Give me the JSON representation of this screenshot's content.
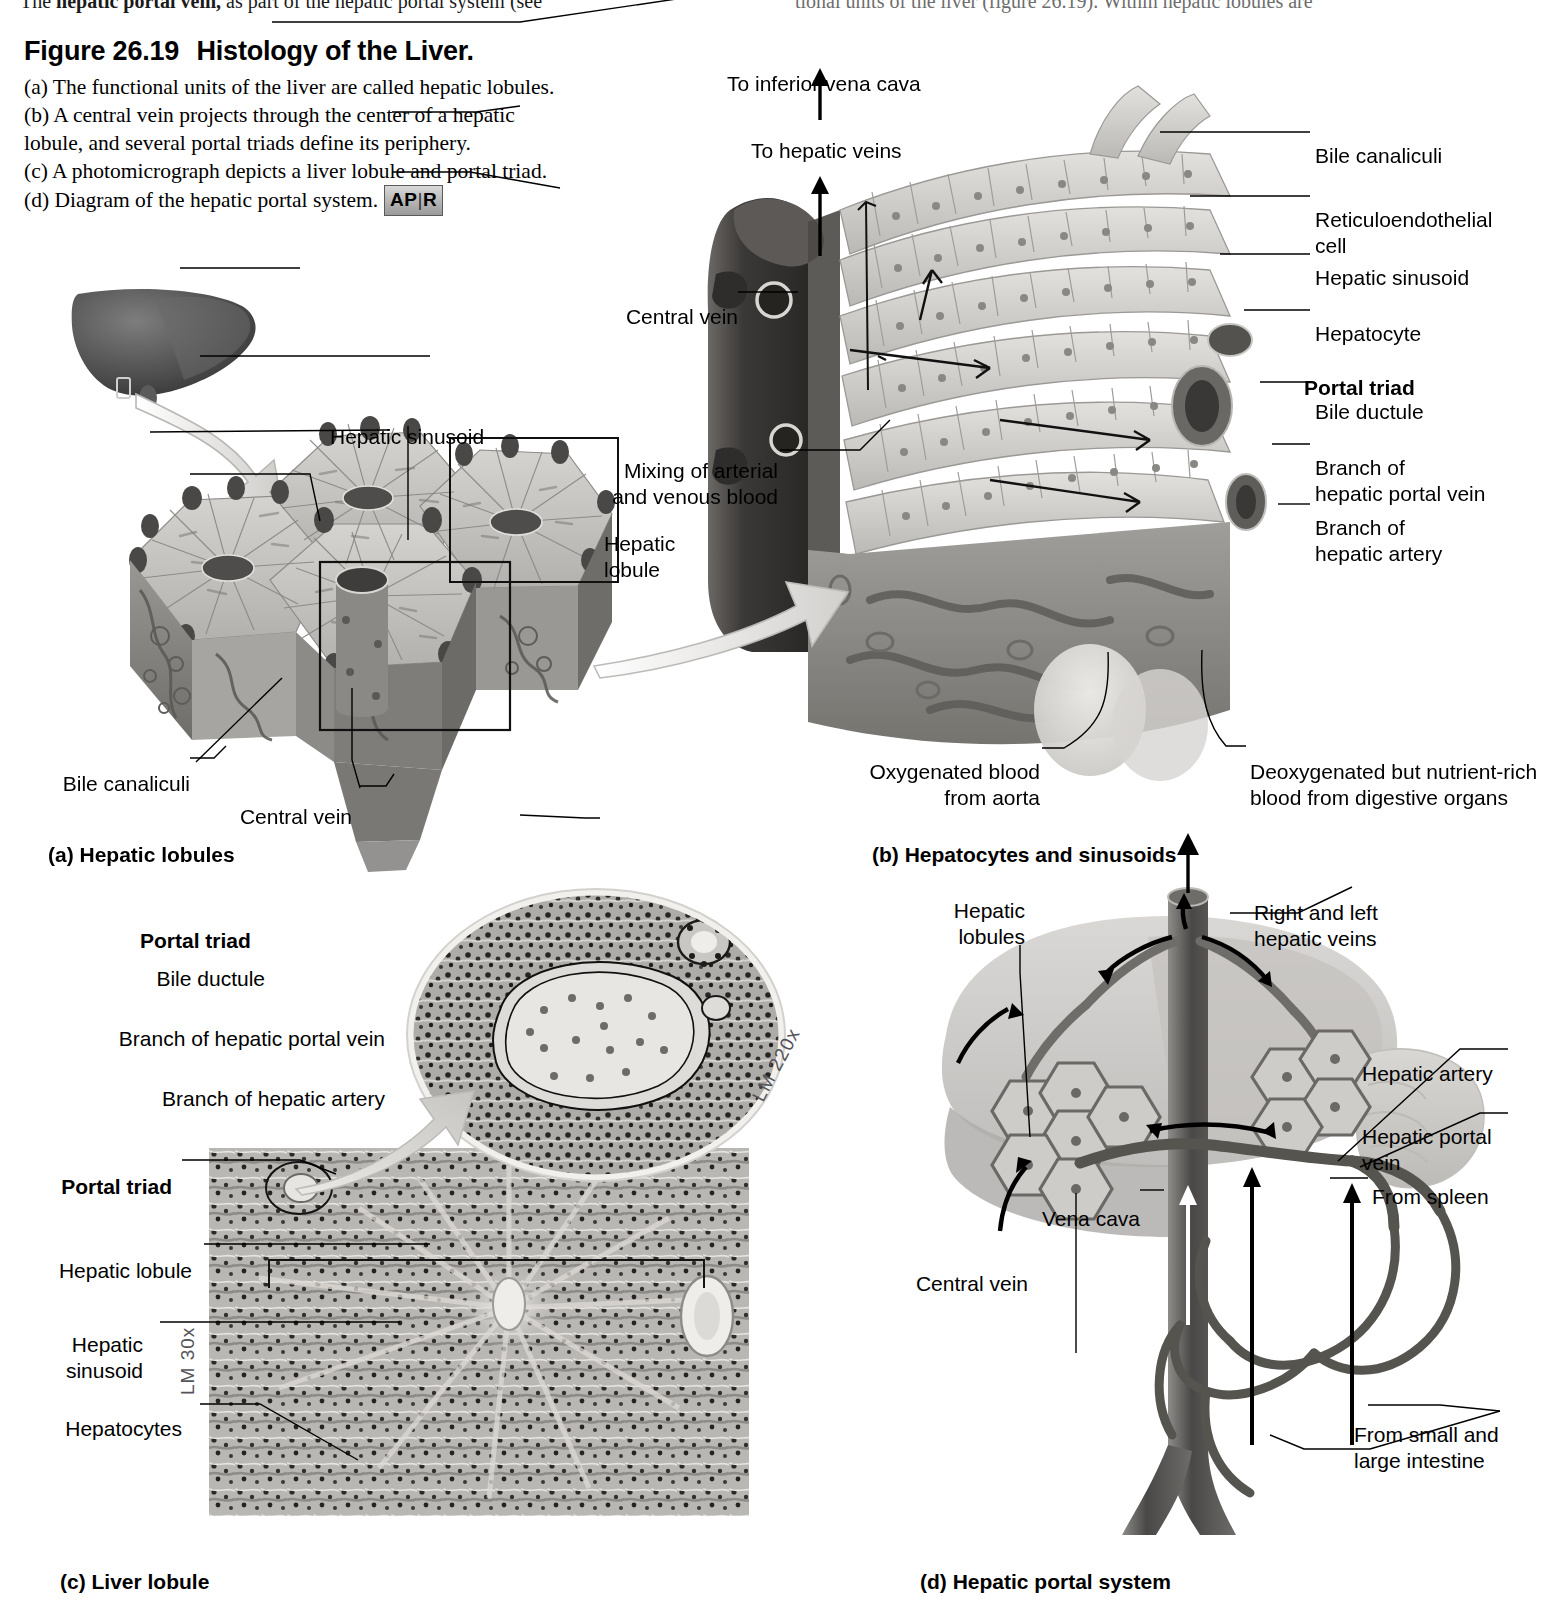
{
  "page": {
    "running_text_left": "The hepatic portal vein, as part of the hepatic portal system (see",
    "running_text_left_bold": "hepatic portal vein,",
    "running_text_right": "tional units of the liver (figure 26.19). Within hepatic lobules are"
  },
  "figure": {
    "number": "Figure 26.19",
    "title": "Histology of the Liver.",
    "caption_a": "(a) The functional units of the liver are called hepatic lobules.",
    "caption_b1": "(b) A central vein projects through the center of a hepatic",
    "caption_b2": "lobule, and several portal triads define its periphery.",
    "caption_c": "(c) A photomicrograph depicts a liver lobule and portal triad.",
    "caption_d": "(d) Diagram of the hepatic portal system.",
    "badge_left": "AP",
    "badge_sep": "|",
    "badge_right": "R"
  },
  "panel_a": {
    "caption": "(a) Hepatic lobules",
    "labels": {
      "hepatic_sinusoid": "Hepatic sinusoid",
      "hepatic_lobule": "Hepatic\nlobule",
      "bile_canaliculi": "Bile canaliculi",
      "central_vein": "Central vein"
    }
  },
  "panel_b": {
    "caption": "(b) Hepatocytes and sinusoids",
    "labels": {
      "to_inferior_vena_cava": "To inferior vena cava",
      "to_hepatic_veins": "To hepatic veins",
      "central_vein": "Central vein",
      "mixing": "Mixing of arterial\nand venous blood",
      "bile_canaliculi": "Bile canaliculi",
      "reticuloendothelial_cell": "Reticuloendothelial\ncell",
      "hepatic_sinusoid": "Hepatic sinusoid",
      "hepatocyte": "Hepatocyte",
      "portal_triad": "Portal triad",
      "bile_ductule": "Bile ductule",
      "branch_portal_vein": "Branch of\nhepatic portal vein",
      "branch_hepatic_artery": "Branch of\nhepatic artery",
      "oxygenated": "Oxygenated blood\nfrom aorta",
      "deoxygenated": "Deoxygenated but nutrient-rich\nblood from digestive organs"
    }
  },
  "panel_c": {
    "caption": "(c) Liver lobule",
    "magnification_inset": "LM 220x",
    "magnification_main": "LM 30x",
    "labels": {
      "portal_triad_inset": "Portal triad",
      "bile_ductule": "Bile ductule",
      "branch_portal_vein": "Branch of hepatic portal vein",
      "branch_hepatic_artery": "Branch of hepatic artery",
      "portal_triad_main": "Portal triad",
      "hepatic_lobule": "Hepatic lobule",
      "hepatic_sinusoid": "Hepatic\nsinusoid",
      "hepatocytes": "Hepatocytes"
    }
  },
  "panel_d": {
    "caption": "(d) Hepatic portal system",
    "labels": {
      "hepatic_lobules": "Hepatic\nlobules",
      "right_left_hepatic_veins": "Right and left\nhepatic veins",
      "hepatic_artery": "Hepatic artery",
      "hepatic_portal_vein": "Hepatic portal\nvein",
      "from_spleen": "From spleen",
      "vena_cava": "Vena cava",
      "central_vein": "Central vein",
      "from_intestine": "From small and\nlarge intestine"
    }
  },
  "colors": {
    "ink": "#000000",
    "art_dark": "#4a4a4a",
    "art_mid": "#8d8d8d",
    "art_light": "#c9c9c9",
    "paper": "#ffffff"
  }
}
